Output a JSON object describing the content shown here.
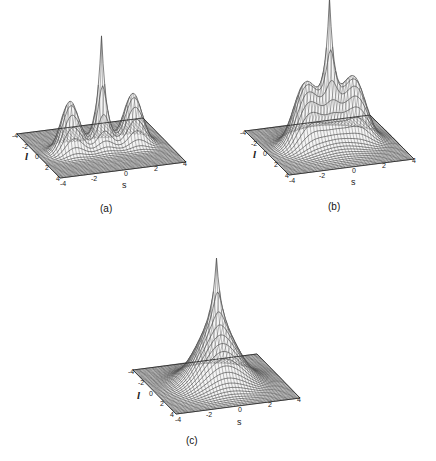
{
  "chart_data": [
    {
      "type": "surface",
      "panel": "a",
      "caption": "(a)",
      "xlabel": "s",
      "ylabel": "l",
      "x_ticks": [
        "-4",
        "-2",
        "0",
        "2",
        "4"
      ],
      "y_ticks": [
        "-4",
        "-2",
        "0",
        "2",
        "4"
      ],
      "xlim": [
        -4,
        4
      ],
      "ylim": [
        -4,
        4
      ],
      "description": "Sharp central peak with two separate side lobes at s = -2 and s = +2",
      "components": [
        {
          "center_s": 0,
          "center_l": 0,
          "height": 1.0,
          "width": 0.35,
          "shape": "cusp"
        },
        {
          "center_s": -2,
          "center_l": 0,
          "height": 0.45,
          "width": 0.55,
          "shape": "gaussian"
        },
        {
          "center_s": 2,
          "center_l": 0,
          "height": 0.45,
          "width": 0.55,
          "shape": "gaussian"
        }
      ]
    },
    {
      "type": "surface",
      "panel": "b",
      "caption": "(b)",
      "xlabel": "s",
      "ylabel": "l",
      "x_ticks": [
        "-4",
        "-2",
        "0",
        "2",
        "4"
      ],
      "y_ticks": [
        "-4",
        "-2",
        "0",
        "2",
        "4"
      ],
      "xlim": [
        -4,
        4
      ],
      "ylim": [
        -4,
        4
      ],
      "description": "Sharp central peak with two side lobes partially merged by a broad base",
      "components": [
        {
          "center_s": 0,
          "center_l": 0,
          "height": 1.0,
          "width": 0.35,
          "shape": "cusp"
        },
        {
          "center_s": -1.6,
          "center_l": 0,
          "height": 0.45,
          "width": 0.7,
          "shape": "gaussian"
        },
        {
          "center_s": 1.6,
          "center_l": 0,
          "height": 0.45,
          "width": 0.7,
          "shape": "gaussian"
        },
        {
          "center_s": 0,
          "center_l": 0,
          "height": 0.22,
          "width": 1.4,
          "shape": "gaussian"
        }
      ]
    },
    {
      "type": "surface",
      "panel": "c",
      "caption": "(c)",
      "xlabel": "s",
      "ylabel": "l",
      "x_ticks": [
        "-4",
        "-2",
        "0",
        "2",
        "4"
      ],
      "y_ticks": [
        "-4",
        "-2",
        "0",
        "2",
        "4"
      ],
      "xlim": [
        -4,
        4
      ],
      "ylim": [
        -4,
        4
      ],
      "description": "Sharp central peak on top of a broad dome-shaped base (side lobes fully merged)",
      "components": [
        {
          "center_s": 0,
          "center_l": 0,
          "height": 0.55,
          "width": 0.3,
          "shape": "cusp"
        },
        {
          "center_s": 0,
          "center_l": 0,
          "height": 0.5,
          "width": 1.25,
          "shape": "gaussian"
        }
      ]
    }
  ]
}
